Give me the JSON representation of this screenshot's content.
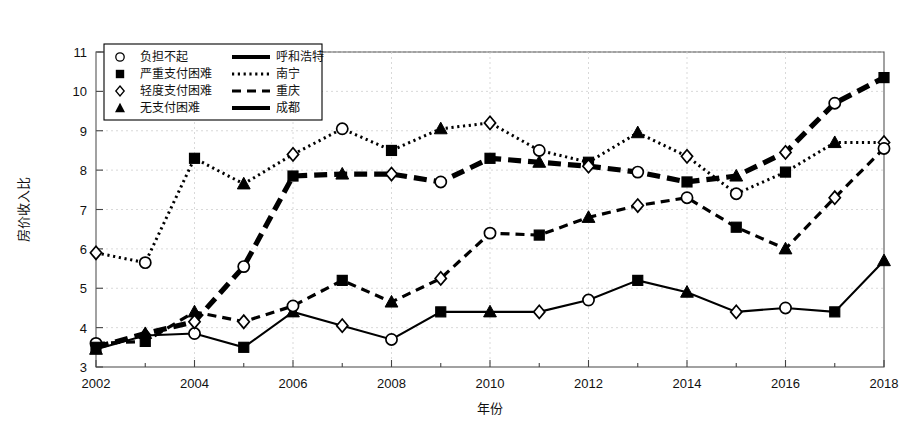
{
  "chart_data": {
    "type": "line",
    "title": "",
    "xlabel": "年份",
    "ylabel": "房价收入比",
    "xlim": [
      2002,
      2018
    ],
    "ylim": [
      3,
      11
    ],
    "grid": true,
    "legend_position": "top-left",
    "x": [
      2002,
      2003,
      2004,
      2005,
      2006,
      2007,
      2008,
      2009,
      2010,
      2011,
      2012,
      2013,
      2014,
      2015,
      2016,
      2017,
      2018
    ],
    "xticks": [
      2002,
      2004,
      2006,
      2008,
      2010,
      2012,
      2014,
      2016,
      2018
    ],
    "xtick_labels": [
      "2002",
      "2004",
      "2006",
      "2008",
      "2010",
      "2012",
      "2014",
      "2016",
      "2018"
    ],
    "yticks": [
      3,
      4,
      5,
      6,
      7,
      8,
      9,
      10,
      11
    ],
    "ytick_labels": [
      "3",
      "4",
      "5",
      "6",
      "7",
      "8",
      "9",
      "10",
      "11"
    ],
    "series": [
      {
        "name": "呼和浩特",
        "style": "solid-thin",
        "values": [
          3.45,
          3.8,
          3.85,
          3.5,
          4.4,
          4.05,
          3.7,
          4.4,
          4.4,
          4.4,
          4.7,
          5.2,
          4.9,
          4.4,
          4.5,
          4.4,
          5.7
        ]
      },
      {
        "name": "南宁",
        "style": "dotted",
        "values": [
          5.9,
          5.65,
          8.3,
          7.65,
          8.4,
          9.05,
          8.5,
          9.05,
          9.2,
          8.5,
          8.2,
          8.95,
          8.35,
          7.4,
          7.95,
          8.7,
          8.7
        ]
      },
      {
        "name": "重庆",
        "style": "dashed",
        "values": [
          3.6,
          3.65,
          4.4,
          4.15,
          4.55,
          5.2,
          4.65,
          5.25,
          6.4,
          6.35,
          6.8,
          7.1,
          7.3,
          6.55,
          6.0,
          7.3,
          8.55
        ]
      },
      {
        "name": "成都",
        "style": "dashed-bold",
        "values": [
          3.5,
          3.85,
          4.15,
          5.55,
          7.85,
          7.9,
          7.9,
          7.7,
          8.3,
          8.2,
          8.1,
          7.95,
          7.7,
          7.85,
          8.45,
          9.7,
          10.35
        ]
      }
    ],
    "marker_sequence": [
      "triangle-filled",
      "diamond-open",
      "circle-open",
      "square-filled"
    ],
    "legend": [
      {
        "marker": "circle-open",
        "marker_label": "负担不起",
        "line_style": "solid-bold",
        "line_label": "呼和浩特"
      },
      {
        "marker": "square-filled",
        "marker_label": "严重支付困难",
        "line_style": "dotted",
        "line_label": "南宁"
      },
      {
        "marker": "diamond-open",
        "marker_label": "轻度支付困难",
        "line_style": "dashed",
        "line_label": "重庆"
      },
      {
        "marker": "triangle-filled",
        "marker_label": "无支付困难",
        "line_style": "solid-bold",
        "line_label": "成都"
      }
    ],
    "colors": {
      "ink": "#000000",
      "grid": "#cfcfcf",
      "frame": "#555555"
    }
  }
}
